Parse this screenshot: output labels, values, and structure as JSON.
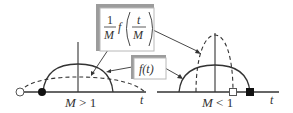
{
  "figure": {
    "left_panel": {
      "condition_label": "M > 1",
      "axis_label": "t",
      "solid_curve": "f(t)",
      "dashed_curve": "(1/M) f(t/M) — wider and shorter",
      "markers": [
        "open-circle",
        "filled-circle"
      ]
    },
    "right_panel": {
      "condition_label": "M < 1",
      "axis_label": "t",
      "solid_curve": "f(t)",
      "dashed_curve": "(1/M) f(t/M) — narrower and taller",
      "markers": [
        "open-square",
        "filled-square"
      ]
    },
    "callouts": {
      "scaled": {
        "frac_num": "1",
        "frac_den": "M",
        "func": "f",
        "inner_num": "t",
        "inner_den": "M"
      },
      "original": {
        "text": "f(t)"
      }
    },
    "colors": {
      "line": "#333333",
      "box_shadow": "#a0a0a0",
      "box_border": "#b8b8b8"
    }
  }
}
